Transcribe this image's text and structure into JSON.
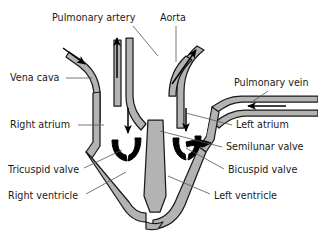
{
  "diagram": {
    "colors": {
      "myocardium_fill": "#b3b3b3",
      "chamber_fill": "#ffffff",
      "outline": "#1a1a1a",
      "leader_line": "#555555",
      "text": "#1a1a1a",
      "background": "#ffffff",
      "valve_fill": "#000000"
    },
    "labels": [
      {
        "id": "pulmonary-artery",
        "text": "Pulmonary artery",
        "x": 52,
        "y": 18,
        "anchor": "start",
        "leader": [
          [
            133,
            26
          ],
          [
            158,
            56
          ]
        ]
      },
      {
        "id": "aorta",
        "text": "Aorta",
        "x": 160,
        "y": 18,
        "anchor": "start",
        "leader": [
          [
            176,
            26
          ],
          [
            176,
            62
          ]
        ]
      },
      {
        "id": "vena-cava",
        "text": "Vena cava",
        "x": 10,
        "y": 78,
        "anchor": "start",
        "leader": [
          [
            66,
            78
          ],
          [
            92,
            78
          ]
        ]
      },
      {
        "id": "pulmonary-vein",
        "text": "Pulmonary vein",
        "x": 234,
        "y": 83,
        "anchor": "start",
        "leader": [
          [
            268,
            91
          ],
          [
            252,
            102
          ]
        ]
      },
      {
        "id": "right-atrium",
        "text": "Right atrium",
        "x": 10,
        "y": 125,
        "anchor": "start",
        "leader": [
          [
            78,
            125
          ],
          [
            104,
            125
          ]
        ]
      },
      {
        "id": "left-atrium",
        "text": "Left atrium",
        "x": 236,
        "y": 125,
        "anchor": "start",
        "leader": [
          [
            232,
            125
          ],
          [
            186,
            113
          ]
        ]
      },
      {
        "id": "semilunar-valve",
        "text": "Semilunar valve",
        "x": 226,
        "y": 147,
        "anchor": "start",
        "leader": [
          [
            222,
            147
          ],
          [
            160,
            131
          ]
        ]
      },
      {
        "id": "tricuspid-valve",
        "text": "Tricuspid valve",
        "x": 8,
        "y": 170,
        "anchor": "start",
        "leader": [
          [
            84,
            168
          ],
          [
            122,
            150
          ]
        ]
      },
      {
        "id": "bicuspid-valve",
        "text": "Bicuspid valve",
        "x": 228,
        "y": 170,
        "anchor": "start",
        "leader": [
          [
            224,
            169
          ],
          [
            186,
            148
          ]
        ]
      },
      {
        "id": "right-ventricle",
        "text": "Right ventricle",
        "x": 8,
        "y": 196,
        "anchor": "start",
        "leader": [
          [
            86,
            194
          ],
          [
            126,
            172
          ]
        ]
      },
      {
        "id": "left-ventricle",
        "text": "Left ventricle",
        "x": 214,
        "y": 196,
        "anchor": "start",
        "leader": [
          [
            210,
            194
          ],
          [
            168,
            176
          ]
        ]
      }
    ],
    "flow_arrows": [
      {
        "id": "vena-cava-inflow",
        "direction": "down-right"
      },
      {
        "id": "pulmonary-artery-out",
        "direction": "up"
      },
      {
        "id": "aorta-outflow",
        "direction": "up-right"
      },
      {
        "id": "pulmonary-vein-inflow",
        "direction": "left"
      },
      {
        "id": "right-atrium-to-ventricle",
        "direction": "down"
      },
      {
        "id": "left-atrium-to-ventricle",
        "direction": "down"
      }
    ]
  }
}
